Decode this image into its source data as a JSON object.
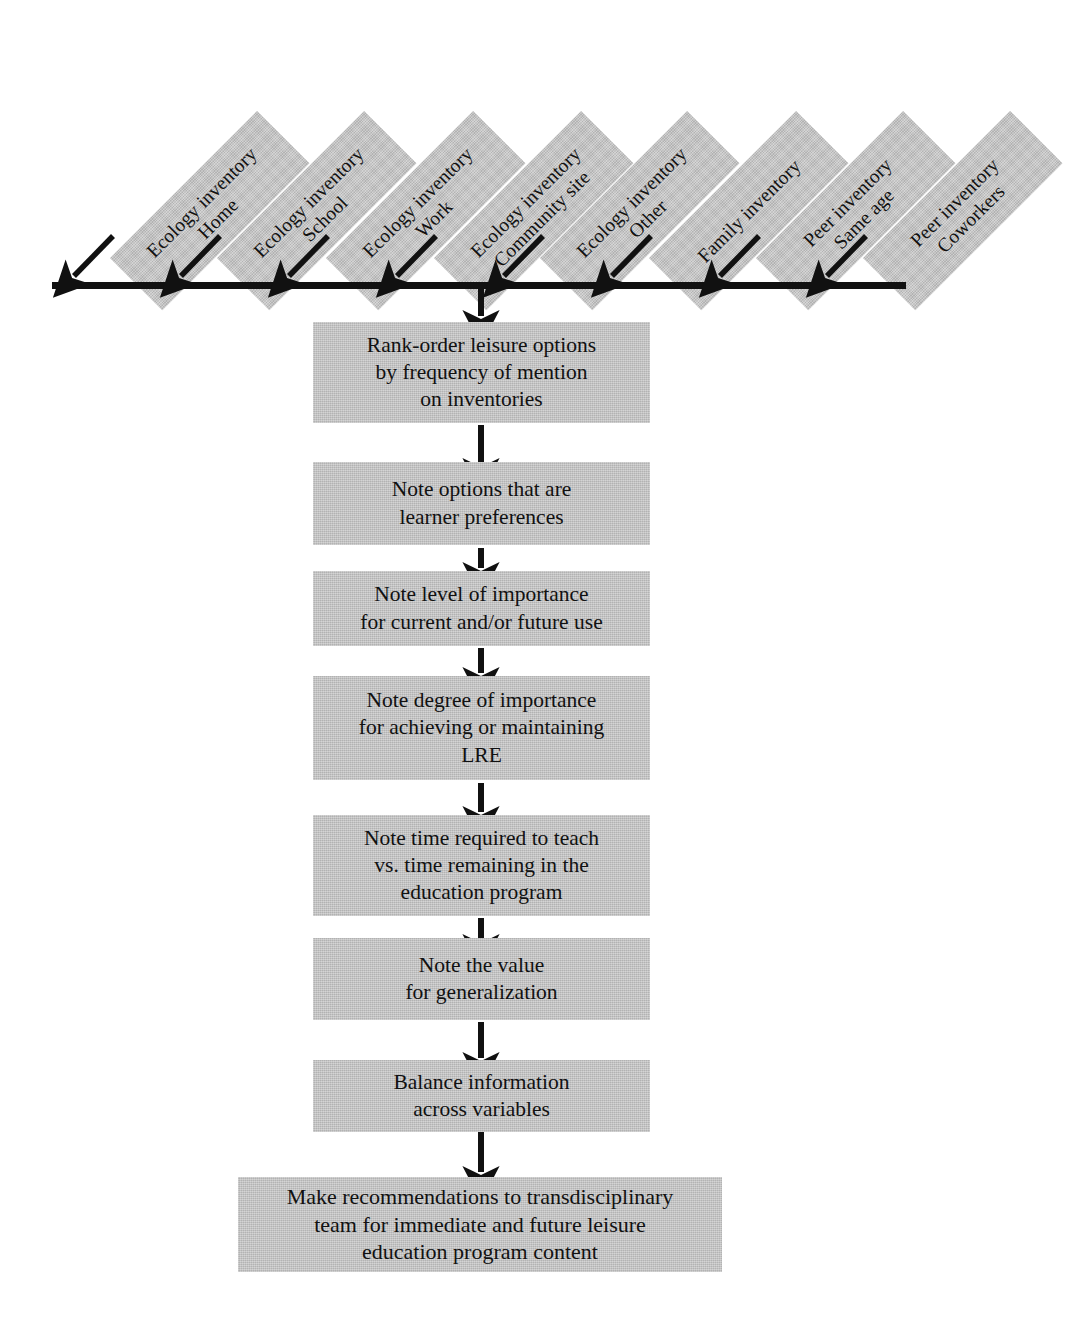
{
  "diagram": {
    "colors": {
      "panel_fill": "#c4c4c4",
      "ink": "#111111",
      "page_background": "#ffffff"
    },
    "inventory_sources": [
      {
        "id": "ecology-home",
        "line1": "Ecology inventory",
        "line2": "Home",
        "label": "Ecology inventory Home"
      },
      {
        "id": "ecology-school",
        "line1": "Ecology inventory",
        "line2": "School",
        "label": "Ecology inventory School"
      },
      {
        "id": "ecology-work",
        "line1": "Ecology inventory",
        "line2": "Work",
        "label": "Ecology inventory Work"
      },
      {
        "id": "ecology-community",
        "line1": "Ecology inventory",
        "line2": "Community site",
        "label": "Ecology inventory Community site"
      },
      {
        "id": "ecology-other",
        "line1": "Ecology inventory",
        "line2": "Other",
        "label": "Ecology inventory Other"
      },
      {
        "id": "family",
        "line1": "Family inventory",
        "line2": "",
        "label": "Family inventory"
      },
      {
        "id": "peer-same-age",
        "line1": "Peer inventory",
        "line2": "Same age",
        "label": "Peer inventory Same age"
      },
      {
        "id": "peer-coworkers",
        "line1": "Peer inventory",
        "line2": "Coworkers",
        "label": "Peer inventory Coworkers"
      }
    ],
    "steps": [
      {
        "id": "rank-order",
        "text": "Rank-order leisure options\nby frequency of mention\non inventories"
      },
      {
        "id": "learner-prefs",
        "text": "Note options that are\nlearner preferences"
      },
      {
        "id": "level-importance",
        "text": "Note level of importance\nfor current and/or future use"
      },
      {
        "id": "degree-importance",
        "text": "Note degree of importance\nfor achieving or maintaining\nLRE"
      },
      {
        "id": "time-required",
        "text": "Note time required to teach\nvs. time remaining in the\neducation program"
      },
      {
        "id": "generalization",
        "text": "Note the value\nfor generalization"
      },
      {
        "id": "balance",
        "text": "Balance information\nacross variables"
      },
      {
        "id": "recommendations",
        "text": "Make recommendations to transdisciplinary\nteam for immediate and future leisure\neducation program content"
      }
    ]
  }
}
